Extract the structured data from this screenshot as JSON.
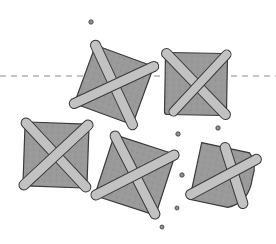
{
  "illustration": {
    "subject": "strapped toast squares with crumbs",
    "colors": {
      "background": "#ffffff",
      "bread": "#9a9a9a",
      "crust": "#c9c9c9",
      "strap": "#c2c2c2",
      "outline": "#3a3a3a",
      "guide_line": "#8a8a8a"
    },
    "guide_line": {
      "y": 76,
      "style": "dashed"
    },
    "pieces": [
      {
        "id": "top-left",
        "cx": 114,
        "cy": 85,
        "size": 62,
        "rotate": 20
      },
      {
        "id": "top-right",
        "cx": 196,
        "cy": 84,
        "size": 62,
        "rotate": 1
      },
      {
        "id": "bottom-left",
        "cx": 56,
        "cy": 155,
        "size": 64,
        "rotate": 2
      },
      {
        "id": "bottom-middle",
        "cx": 135,
        "cy": 175,
        "size": 64,
        "rotate": 18
      },
      {
        "id": "bottom-right",
        "cx": 224,
        "cy": 177,
        "size": 58,
        "rotate": 12,
        "bitten": true
      }
    ],
    "crumbs": [
      {
        "x": 91,
        "y": 22
      },
      {
        "x": 178,
        "y": 134
      },
      {
        "x": 218,
        "y": 128
      },
      {
        "x": 182,
        "y": 175
      },
      {
        "x": 177,
        "y": 208
      },
      {
        "x": 162,
        "y": 227
      }
    ]
  }
}
